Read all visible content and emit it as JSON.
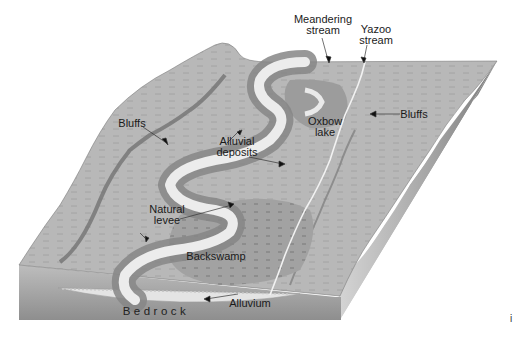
{
  "figure": {
    "colors": {
      "plain": "#b9b9b9",
      "bluff_band": "#8a8a8a",
      "channel": "#eeeeee",
      "levee": "#8f8f8f",
      "backswamp": "#a3a3a3",
      "bedrock": "#9a9a9a",
      "alluvium": "#e2e2e2"
    },
    "labels": {
      "meandering_stream": "Meandering\nstream",
      "yazoo_stream": "Yazoo\nstream",
      "bluffs_left": "Bluffs",
      "bluffs_right": "Bluffs",
      "alluvial_deposits": "Alluvial\ndeposits",
      "oxbow_lake": "Oxbow\nlake",
      "natural_levee": "Natural\nlevee",
      "backswamp": "Backswamp",
      "bedrock": "Bedrock",
      "alluvium": "Alluvium"
    },
    "corner_mark": "i"
  }
}
